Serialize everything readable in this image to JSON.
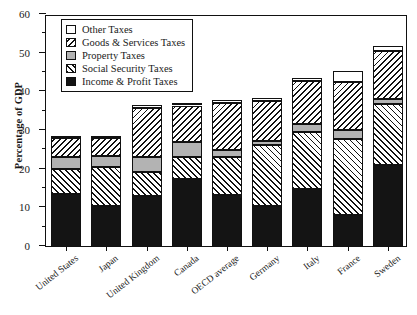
{
  "chart_data": {
    "type": "bar",
    "stacked": true,
    "title": "",
    "subtitle": "",
    "xlabel": "",
    "ylabel": "Percentage of GDP",
    "ylim": [
      0,
      60
    ],
    "ytick_labels": [
      "0",
      "10",
      "20",
      "30",
      "40",
      "50",
      "60"
    ],
    "ytick_values": [
      0,
      10,
      20,
      30,
      40,
      50,
      60
    ],
    "yminor_values": [
      5,
      15,
      25,
      35,
      45,
      55
    ],
    "grid": false,
    "legend_position": "upper left",
    "categories": [
      "United States",
      "Japan",
      "United Kingdom",
      "Canada",
      "OECD average",
      "Germany",
      "Italy",
      "France",
      "Sweden"
    ],
    "series": [
      {
        "name": "Income & Profit Taxes",
        "pattern": "solid-black",
        "color": "#141414",
        "values": [
          13.8,
          10.5,
          13.2,
          17.5,
          13.5,
          10.7,
          14.9,
          8.3,
          21.2
        ]
      },
      {
        "name": "Social Security Taxes",
        "pattern": "forward-hatch",
        "color": "#ffffff",
        "values": [
          6.5,
          10.2,
          6.2,
          5.8,
          9.7,
          15.8,
          14.8,
          19.6,
          15.7
        ]
      },
      {
        "name": "Property Taxes",
        "pattern": "solid-gray",
        "color": "#b3b3b3",
        "values": [
          3.0,
          2.8,
          3.9,
          3.8,
          1.9,
          1.0,
          2.1,
          2.3,
          1.5
        ]
      },
      {
        "name": "Goods & Services Taxes",
        "pattern": "back-hatch",
        "color": "#ffffff",
        "values": [
          4.8,
          4.6,
          12.7,
          9.5,
          12.2,
          10.3,
          11.2,
          12.5,
          12.2
        ]
      },
      {
        "name": "Other Taxes",
        "pattern": "solid-white",
        "color": "#ffffff",
        "values": [
          0.4,
          0.3,
          0.2,
          0.4,
          0.5,
          0.2,
          0.1,
          2.9,
          1.4
        ]
      }
    ],
    "totals": [
      28.5,
      28.4,
      36.2,
      37.0,
      37.8,
      38.0,
      43.1,
      45.6,
      52.0
    ],
    "legend_order": [
      "Other Taxes",
      "Goods & Services Taxes",
      "Property Taxes",
      "Social Security Taxes",
      "Income & Profit Taxes"
    ]
  }
}
